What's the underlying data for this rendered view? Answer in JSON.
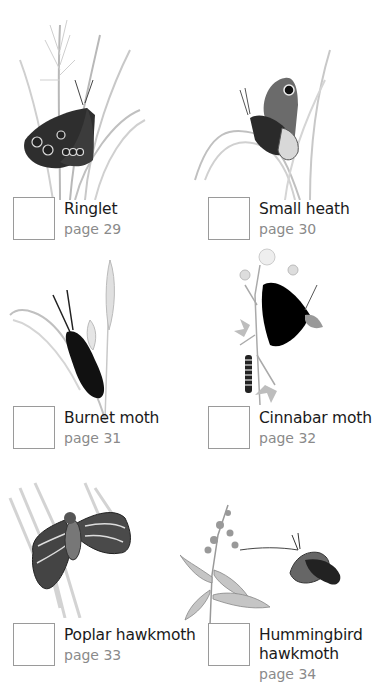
{
  "species": [
    {
      "name": "Ringlet",
      "page": "page 29",
      "illustration": "ringlet-butterfly-on-grass-icon"
    },
    {
      "name": "Small heath",
      "page": "page 30",
      "illustration": "small-heath-butterfly-on-grass-icon"
    },
    {
      "name": "Burnet moth",
      "page": "page 31",
      "illustration": "burnet-moth-on-grass-icon"
    },
    {
      "name": "Cinnabar moth",
      "page": "page 32",
      "illustration": "cinnabar-moth-and-caterpillar-on-ragwort-icon"
    },
    {
      "name": "Poplar hawkmoth",
      "page": "page 33",
      "illustration": "poplar-hawkmoth-on-bark-icon"
    },
    {
      "name_line1": "Hummingbird",
      "name_line2": "hawkmoth",
      "page": "page 34",
      "illustration": "hummingbird-hawkmoth-at-flower-icon"
    }
  ]
}
